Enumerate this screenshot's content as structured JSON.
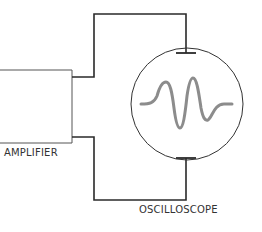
{
  "labels": {
    "amplifier": "AMPLIFIER",
    "oscilloscope": "OSCILLOSCOPE"
  },
  "colors": {
    "wire": "#2a2a2a",
    "box": "#555555",
    "screen_outline": "#333333",
    "waveform": "#8c8c8c",
    "text": "#333333"
  }
}
